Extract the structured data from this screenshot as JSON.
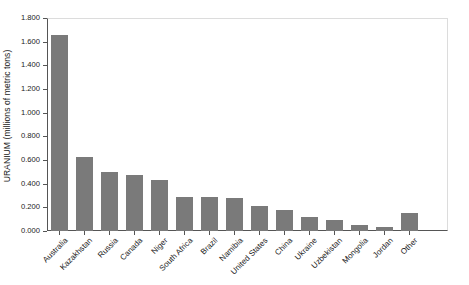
{
  "chart_data": {
    "type": "bar",
    "title": "",
    "xlabel": "",
    "ylabel": "URANIUM (millions of metric tons)",
    "ylim": [
      0,
      1.8
    ],
    "ytick_step": 0.2,
    "grid": false,
    "legend": "none",
    "bar_color": "#7a7a7a",
    "axis_color": "#555555",
    "background": "#ffffff",
    "ytick_labels": [
      "1.800",
      "1.600",
      "1.400",
      "1.200",
      "1.000",
      "0.800",
      "0.600",
      "0.400",
      "0.200",
      "0.000"
    ],
    "ytick_values": [
      1.8,
      1.6,
      1.4,
      1.2,
      1.0,
      0.8,
      0.6,
      0.4,
      0.2,
      0.0
    ],
    "categories": [
      "Australia",
      "Kazakhstan",
      "Russia",
      "Canada",
      "Niger",
      "South Africa",
      "Brazil",
      "Namibia",
      "United States",
      "China",
      "Ukraine",
      "Uzbekistan",
      "Mongolia",
      "Jordan",
      "Other"
    ],
    "values": [
      1.66,
      0.625,
      0.495,
      0.475,
      0.43,
      0.29,
      0.285,
      0.275,
      0.215,
      0.175,
      0.115,
      0.095,
      0.05,
      0.035,
      0.155
    ]
  }
}
